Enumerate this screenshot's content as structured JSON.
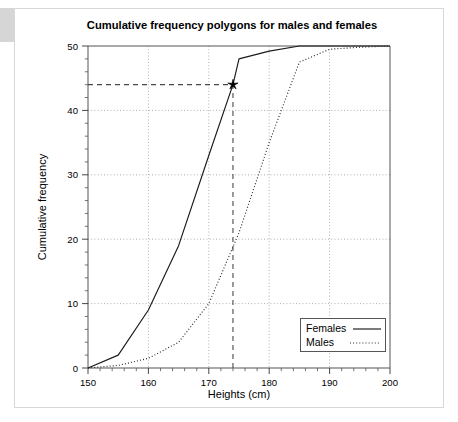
{
  "figure": {
    "title": "Cumulative frequency polygons for males and females",
    "background_color": "#ffffff",
    "frame_color": "#d8d8d8",
    "edge_block_color": "#d6d6d6"
  },
  "chart_data": {
    "type": "line",
    "title": "Cumulative frequency polygons for males and females",
    "xlabel": "Heights (cm)",
    "ylabel": "Cumulative frequency",
    "xlim": [
      150,
      200
    ],
    "ylim": [
      0,
      50
    ],
    "xticks": [
      150,
      160,
      170,
      180,
      190,
      200
    ],
    "yticks": [
      0,
      10,
      20,
      30,
      40,
      50
    ],
    "xtick_labels": [
      "150",
      "160",
      "170",
      "180",
      "190",
      "200"
    ],
    "ytick_labels": [
      "0",
      "10",
      "20",
      "30",
      "40",
      "50"
    ],
    "x_minor_tick_step": 2,
    "y_minor_tick_step": 2,
    "grid": true,
    "grid_style": "dotted",
    "legend_position": "lower right",
    "series": [
      {
        "name": "Females",
        "style": "solid",
        "color": "#1a1a1a",
        "x": [
          150,
          155,
          160,
          165,
          170,
          174,
          175,
          180,
          185,
          190,
          195,
          200
        ],
        "y": [
          0,
          2,
          9,
          19,
          33,
          44,
          48,
          49.2,
          50,
          50,
          50,
          50
        ]
      },
      {
        "name": "Males",
        "style": "dotted",
        "color": "#2b2b2b",
        "x": [
          150,
          155,
          160,
          165,
          170,
          175,
          180,
          185,
          190,
          195,
          200
        ],
        "y": [
          0,
          0.4,
          1.5,
          4,
          10,
          21,
          35,
          47.5,
          49.5,
          49.8,
          50
        ]
      }
    ],
    "annotations": [
      {
        "name": "median-marker",
        "marker": "star",
        "x": 174,
        "y": 44,
        "guide_lines": [
          {
            "orientation": "horizontal",
            "value": 44,
            "from_x": 150,
            "to_x": 174,
            "style": "dashed"
          },
          {
            "orientation": "vertical",
            "value": 174,
            "from_y": 0,
            "to_y": 44,
            "style": "dashed"
          }
        ]
      }
    ]
  },
  "legend": {
    "entries": [
      {
        "label": "Females",
        "style": "solid"
      },
      {
        "label": "Males",
        "style": "dotted"
      }
    ]
  }
}
